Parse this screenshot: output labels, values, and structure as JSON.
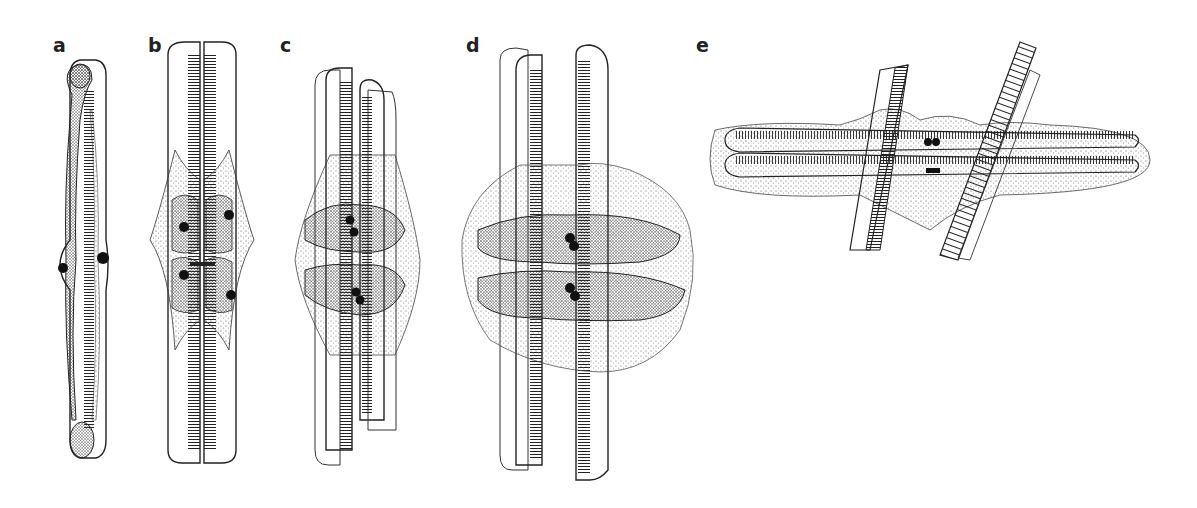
{
  "figure": {
    "panels": [
      {
        "id": "a",
        "label": "a",
        "label_pos": [
          53,
          48
        ]
      },
      {
        "id": "b",
        "label": "b",
        "label_pos": [
          148,
          48
        ]
      },
      {
        "id": "c",
        "label": "c",
        "label_pos": [
          280,
          48
        ]
      },
      {
        "id": "d",
        "label": "d",
        "label_pos": [
          466,
          48
        ]
      },
      {
        "id": "e",
        "label": "e",
        "label_pos": [
          696,
          48
        ]
      }
    ]
  }
}
